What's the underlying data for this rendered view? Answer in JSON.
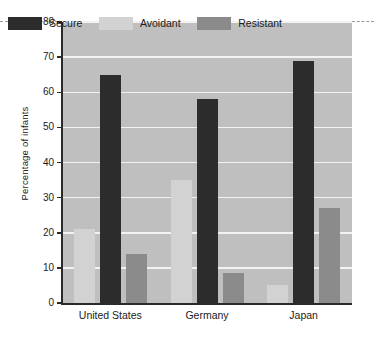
{
  "chart_data": {
    "type": "bar",
    "title": "",
    "xlabel": "",
    "ylabel": "Percentage of infants",
    "categories": [
      "United States",
      "Germany",
      "Japan"
    ],
    "series": [
      {
        "name": "Secure",
        "color": "#2c2c2c",
        "values": [
          65,
          58,
          69
        ]
      },
      {
        "name": "Avoidant",
        "color": "#d2d2d2",
        "values": [
          21,
          35,
          5
        ]
      },
      {
        "name": "Resistant",
        "color": "#8b8b8b",
        "values": [
          14,
          8.5,
          27
        ]
      }
    ],
    "series_order_in_plot": [
      "Avoidant",
      "Secure",
      "Resistant"
    ],
    "ylim": [
      0,
      80
    ],
    "yticks": [
      0,
      10,
      20,
      30,
      40,
      50,
      60,
      70,
      80
    ],
    "ytick_labels": [
      "0",
      "10",
      "20",
      "30",
      "40",
      "50",
      "60",
      "70",
      "80"
    ],
    "grid": true,
    "grid_axis": "y",
    "legend_position": "upper-left-inside",
    "plot_background": "#bfbfbf",
    "gridline_color": "#f2f2f2",
    "axis_color": "#2a2a2a"
  },
  "legend": {
    "items": [
      {
        "label": "Secure"
      },
      {
        "label": "Avoidant"
      },
      {
        "label": "Resistant"
      }
    ]
  },
  "axis": {
    "y_title": "Percentage of infants"
  }
}
